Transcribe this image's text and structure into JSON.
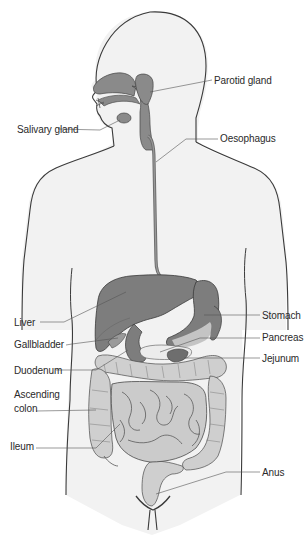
{
  "diagram": {
    "colors": {
      "background": "#ffffff",
      "body_fill": "#f2f2f2",
      "outline": "#3a3a3a",
      "organ_dark": "#7a7a7a",
      "organ_mid": "#9a9a9a",
      "organ_light": "#c4c4c4",
      "intestine_fill": "#cfcfcf",
      "leader_line": "#555555",
      "label_text": "#2a2a2a"
    },
    "labels": [
      {
        "id": "parotid-gland",
        "text": "Parotid gland",
        "side": "right",
        "x": 214,
        "y": 75
      },
      {
        "id": "salivary-gland",
        "text": "Salivary gland",
        "side": "left",
        "x": 17,
        "y": 124
      },
      {
        "id": "oesophagus",
        "text": "Oesophagus",
        "side": "right",
        "x": 220,
        "y": 133
      },
      {
        "id": "liver",
        "text": "Liver",
        "side": "left",
        "x": 14,
        "y": 317
      },
      {
        "id": "stomach",
        "text": "Stomach",
        "side": "right",
        "x": 262,
        "y": 310
      },
      {
        "id": "gallbladder",
        "text": "Gallbladder",
        "side": "left",
        "x": 14,
        "y": 339
      },
      {
        "id": "pancreas",
        "text": "Pancreas",
        "side": "right",
        "x": 262,
        "y": 332
      },
      {
        "id": "jejunum",
        "text": "Jejunum",
        "side": "right",
        "x": 262,
        "y": 353
      },
      {
        "id": "duodenum",
        "text": "Duodenum",
        "side": "left",
        "x": 14,
        "y": 365
      },
      {
        "id": "ascending-colon-1",
        "text": "Ascending",
        "side": "left",
        "x": 14,
        "y": 389
      },
      {
        "id": "ascending-colon-2",
        "text": "colon",
        "side": "left",
        "x": 14,
        "y": 403
      },
      {
        "id": "ileum",
        "text": "Ileum",
        "side": "left",
        "x": 10,
        "y": 441
      },
      {
        "id": "anus",
        "text": "Anus",
        "side": "right",
        "x": 262,
        "y": 467
      }
    ]
  }
}
